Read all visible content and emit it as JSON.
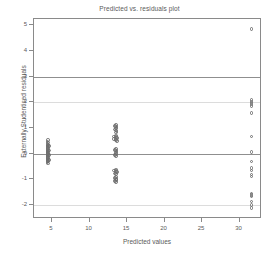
{
  "chart_data": {
    "type": "scatter",
    "title": "Predicted vs. residuals plot",
    "xlabel": "Predicted values",
    "ylabel": "Externally Studentised residuals",
    "xlim": [
      2.6,
      33.0
    ],
    "ylim": [
      -2.55,
      5.25
    ],
    "xticks": [
      5,
      10,
      15,
      20,
      25,
      30
    ],
    "xtick_labels": [
      "5",
      "10",
      "15",
      "20",
      "25",
      "30"
    ],
    "yticks": [
      -2,
      -1,
      0,
      1,
      2,
      3,
      4,
      5
    ],
    "ytick_labels": [
      "-2",
      "-1",
      "0",
      "1",
      "2",
      "3",
      "4",
      "5"
    ],
    "grid": false,
    "legend": "none",
    "marker": "open-circle",
    "marker_color": "#6e6e6e",
    "reference_lines": [
      {
        "y": 3,
        "style": "solid",
        "color": "#8f8f8f"
      },
      {
        "y": 2,
        "style": "solid",
        "color": "#dcdcdc"
      },
      {
        "y": 0,
        "style": "solid",
        "color": "#8f8f8f"
      },
      {
        "y": -2,
        "style": "solid",
        "color": "#dcdcdc"
      }
    ],
    "series": [
      {
        "name": "residuals",
        "points": [
          [
            4.5,
            0.52
          ],
          [
            4.5,
            0.44
          ],
          [
            4.5,
            0.36
          ],
          [
            4.5,
            0.29
          ],
          [
            4.5,
            0.22
          ],
          [
            4.5,
            0.15
          ],
          [
            4.5,
            0.08
          ],
          [
            4.5,
            0.02
          ],
          [
            4.5,
            -0.04
          ],
          [
            4.5,
            -0.1
          ],
          [
            4.5,
            -0.17
          ],
          [
            4.5,
            -0.24
          ],
          [
            4.5,
            -0.31
          ],
          [
            4.5,
            -0.38
          ],
          [
            4.4,
            0.48
          ],
          [
            4.4,
            0.4
          ],
          [
            4.4,
            0.32
          ],
          [
            4.4,
            0.25
          ],
          [
            4.4,
            0.18
          ],
          [
            4.4,
            0.11
          ],
          [
            4.4,
            0.05
          ],
          [
            4.4,
            -0.01
          ],
          [
            4.4,
            -0.07
          ],
          [
            4.4,
            -0.14
          ],
          [
            4.4,
            -0.21
          ],
          [
            4.4,
            -0.28
          ],
          [
            4.4,
            -0.35
          ],
          [
            4.6,
            0.3
          ],
          [
            4.6,
            0.12
          ],
          [
            4.6,
            -0.06
          ],
          [
            4.6,
            -0.26
          ],
          [
            13.5,
            1.12
          ],
          [
            13.5,
            1.05
          ],
          [
            13.5,
            0.98
          ],
          [
            13.5,
            0.9
          ],
          [
            13.5,
            0.82
          ],
          [
            13.4,
            1.08
          ],
          [
            13.6,
            1.02
          ],
          [
            13.4,
            0.94
          ],
          [
            13.6,
            0.86
          ],
          [
            13.5,
            0.7
          ],
          [
            13.5,
            0.64
          ],
          [
            13.5,
            0.58
          ],
          [
            13.5,
            0.52
          ],
          [
            13.3,
            0.66
          ],
          [
            13.7,
            0.62
          ],
          [
            13.3,
            0.56
          ],
          [
            13.7,
            0.5
          ],
          [
            13.5,
            0.18
          ],
          [
            13.5,
            0.12
          ],
          [
            13.5,
            0.05
          ],
          [
            13.5,
            -0.02
          ],
          [
            13.5,
            -0.09
          ],
          [
            13.4,
            0.14
          ],
          [
            13.6,
            0.08
          ],
          [
            13.4,
            -0.05
          ],
          [
            13.5,
            -0.62
          ],
          [
            13.5,
            -0.68
          ],
          [
            13.5,
            -0.74
          ],
          [
            13.5,
            -0.8
          ],
          [
            13.3,
            -0.66
          ],
          [
            13.7,
            -0.71
          ],
          [
            13.4,
            -0.78
          ],
          [
            13.5,
            -0.92
          ],
          [
            13.5,
            -0.98
          ],
          [
            13.5,
            -1.04
          ],
          [
            13.5,
            -1.1
          ],
          [
            13.4,
            -0.95
          ],
          [
            13.6,
            -1.01
          ],
          [
            13.4,
            -1.07
          ],
          [
            31.6,
            4.86
          ],
          [
            31.6,
            2.1
          ],
          [
            31.6,
            2.02
          ],
          [
            31.6,
            1.93
          ],
          [
            31.6,
            1.86
          ],
          [
            31.6,
            1.58
          ],
          [
            31.6,
            0.66
          ],
          [
            31.6,
            0.06
          ],
          [
            31.6,
            -0.3
          ],
          [
            31.6,
            -0.56
          ],
          [
            31.6,
            -0.66
          ],
          [
            31.6,
            -0.82
          ],
          [
            31.6,
            -0.9
          ],
          [
            31.6,
            -1.56
          ],
          [
            31.6,
            -1.62
          ],
          [
            31.6,
            -1.68
          ],
          [
            31.6,
            -1.86
          ],
          [
            31.6,
            -2.0
          ],
          [
            31.6,
            -2.12
          ]
        ]
      }
    ]
  }
}
